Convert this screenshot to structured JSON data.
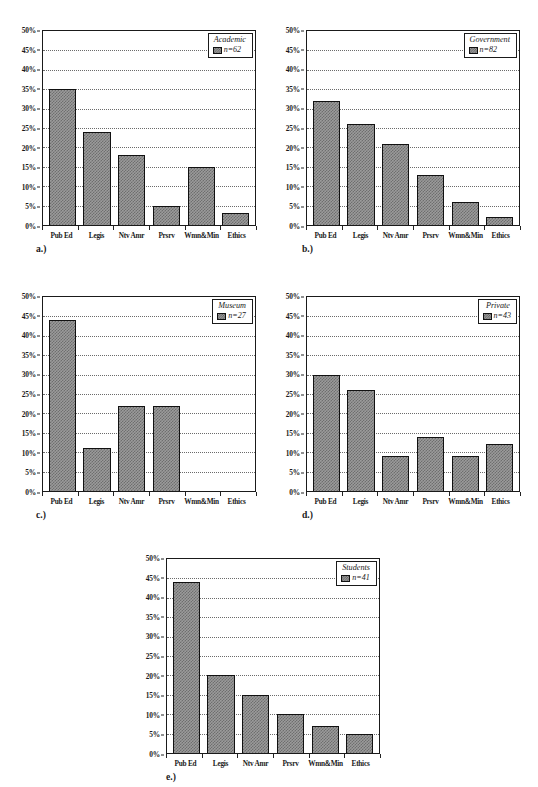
{
  "figure": {
    "categories": [
      "Pub Ed",
      "Legis",
      "Ntv Amr",
      "Prsrv",
      "Wmn&Min",
      "Ethics"
    ],
    "y_ticks": [
      "0%",
      "5%",
      "10%",
      "15%",
      "20%",
      "25%",
      "30%",
      "35%",
      "40%",
      "45%",
      "50%"
    ],
    "panels": [
      {
        "letter": "a.)",
        "legend_title": "Academic",
        "legend_series": "n=62",
        "values": [
          35,
          24,
          18,
          5,
          15,
          3
        ]
      },
      {
        "letter": "b.)",
        "legend_title": "Government",
        "legend_series": "n=82",
        "values": [
          32,
          26,
          21,
          13,
          6,
          2
        ]
      },
      {
        "letter": "c.)",
        "legend_title": "Museum",
        "legend_series": "n=27",
        "values": [
          44,
          11,
          22,
          22,
          0,
          0
        ]
      },
      {
        "letter": "d.)",
        "legend_title": "Private",
        "legend_series": "n=43",
        "values": [
          30,
          26,
          9,
          14,
          9,
          12
        ]
      },
      {
        "letter": "e.)",
        "legend_title": "Students",
        "legend_series": "n=41",
        "values": [
          44,
          20,
          15,
          10,
          7,
          5
        ]
      }
    ]
  },
  "chart_data": [
    {
      "type": "bar",
      "title": "Academic",
      "legend": [
        "n=62"
      ],
      "categories": [
        "Pub Ed",
        "Legis",
        "Ntv Amr",
        "Prsrv",
        "Wmn&Min",
        "Ethics"
      ],
      "values": [
        35,
        24,
        18,
        5,
        15,
        3
      ],
      "xlabel": "",
      "ylabel": "",
      "ylim": [
        0,
        50
      ],
      "ytick_labels": [
        "0%",
        "5%",
        "10%",
        "15%",
        "20%",
        "25%",
        "30%",
        "35%",
        "40%",
        "45%",
        "50%"
      ],
      "grid": true,
      "legend_position": "top-right",
      "annotations": [
        "a.)"
      ]
    },
    {
      "type": "bar",
      "title": "Government",
      "legend": [
        "n=82"
      ],
      "categories": [
        "Pub Ed",
        "Legis",
        "Ntv Amr",
        "Prsrv",
        "Wmn&Min",
        "Ethics"
      ],
      "values": [
        32,
        26,
        21,
        13,
        6,
        2
      ],
      "xlabel": "",
      "ylabel": "",
      "ylim": [
        0,
        50
      ],
      "ytick_labels": [
        "0%",
        "5%",
        "10%",
        "15%",
        "20%",
        "25%",
        "30%",
        "35%",
        "40%",
        "45%",
        "50%"
      ],
      "grid": true,
      "legend_position": "top-right",
      "annotations": [
        "b.)"
      ]
    },
    {
      "type": "bar",
      "title": "Museum",
      "legend": [
        "n=27"
      ],
      "categories": [
        "Pub Ed",
        "Legis",
        "Ntv Amr",
        "Prsrv",
        "Wmn&Min",
        "Ethics"
      ],
      "values": [
        44,
        11,
        22,
        22,
        0,
        0
      ],
      "xlabel": "",
      "ylabel": "",
      "ylim": [
        0,
        50
      ],
      "ytick_labels": [
        "0%",
        "5%",
        "10%",
        "15%",
        "20%",
        "25%",
        "30%",
        "35%",
        "40%",
        "45%",
        "50%"
      ],
      "grid": true,
      "legend_position": "top-right",
      "annotations": [
        "c.)"
      ]
    },
    {
      "type": "bar",
      "title": "Private",
      "legend": [
        "n=43"
      ],
      "categories": [
        "Pub Ed",
        "Legis",
        "Ntv Amr",
        "Prsrv",
        "Wmn&Min",
        "Ethics"
      ],
      "values": [
        30,
        26,
        9,
        14,
        9,
        12
      ],
      "xlabel": "",
      "ylabel": "",
      "ylim": [
        0,
        50
      ],
      "ytick_labels": [
        "0%",
        "5%",
        "10%",
        "15%",
        "20%",
        "25%",
        "30%",
        "35%",
        "40%",
        "45%",
        "50%"
      ],
      "grid": true,
      "legend_position": "top-right",
      "annotations": [
        "d.)"
      ]
    },
    {
      "type": "bar",
      "title": "Students",
      "legend": [
        "n=41"
      ],
      "categories": [
        "Pub Ed",
        "Legis",
        "Ntv Amr",
        "Prsrv",
        "Wmn&Min",
        "Ethics"
      ],
      "values": [
        44,
        20,
        15,
        10,
        7,
        5
      ],
      "xlabel": "",
      "ylabel": "",
      "ylim": [
        0,
        50
      ],
      "ytick_labels": [
        "0%",
        "5%",
        "10%",
        "15%",
        "20%",
        "25%",
        "30%",
        "35%",
        "40%",
        "45%",
        "50%"
      ],
      "grid": true,
      "legend_position": "top-right",
      "annotations": [
        "e.)"
      ]
    }
  ]
}
